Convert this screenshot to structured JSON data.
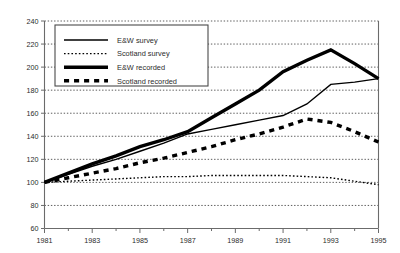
{
  "chart_data": {
    "type": "line",
    "title": "",
    "subtitle": "",
    "xlabel": "",
    "ylabel": "",
    "xlim": [
      1981,
      1995
    ],
    "ylim": [
      60,
      240
    ],
    "yticks": [
      60,
      80,
      100,
      120,
      140,
      160,
      180,
      200,
      220,
      240
    ],
    "xticks": [
      1981,
      1982,
      1983,
      1984,
      1985,
      1986,
      1987,
      1988,
      1989,
      1990,
      1991,
      1992,
      1993,
      1994,
      1995
    ],
    "xtick_labels": [
      "1981",
      "",
      "1983",
      "",
      "1985",
      "",
      "1987",
      "",
      "1989",
      "",
      "1991",
      "",
      "1993",
      "",
      "1995"
    ],
    "ytick_labels": [
      "60",
      "80",
      "100",
      "120",
      "140",
      "160",
      "180",
      "200",
      "220",
      "240"
    ],
    "grid": "horizontal-dotted",
    "legend_position": "top-left-inside",
    "x": [
      1981,
      1982,
      1983,
      1984,
      1985,
      1986,
      1987,
      1988,
      1989,
      1990,
      1991,
      1992,
      1993,
      1994,
      1995
    ],
    "series": [
      {
        "name": "E&W survey",
        "style": "thin-solid",
        "color": "#000000",
        "width": 1.4,
        "values": [
          100,
          107,
          114,
          120,
          127,
          134,
          142,
          146,
          150,
          154,
          158,
          168,
          185,
          187,
          190
        ]
      },
      {
        "name": "Scotland survey",
        "style": "thin-dotted",
        "color": "#000000",
        "width": 1.4,
        "values": [
          100,
          101,
          102,
          103,
          104,
          105,
          105,
          106,
          106,
          106,
          106,
          105,
          104,
          101,
          98
        ]
      },
      {
        "name": "E&W recorded",
        "style": "thick-solid",
        "color": "#000000",
        "width": 3.4,
        "values": [
          100,
          108,
          116,
          123,
          131,
          137,
          144,
          156,
          168,
          180,
          196,
          206,
          215,
          203,
          190
        ]
      },
      {
        "name": "Scotland recorded",
        "style": "thick-dashed",
        "color": "#000000",
        "width": 3.4,
        "values": [
          100,
          104,
          108,
          112,
          117,
          121,
          126,
          131,
          137,
          142,
          148,
          155,
          152,
          144,
          135
        ]
      }
    ]
  },
  "legend": {
    "items": [
      {
        "label": "E&W survey",
        "key": "ew-survey"
      },
      {
        "label": "Scotland survey",
        "key": "scotland-survey"
      },
      {
        "label": "E&W recorded",
        "key": "ew-recorded"
      },
      {
        "label": "Scotland recorded",
        "key": "scotland-recorded"
      }
    ]
  },
  "axis": {
    "y_labels": [
      "240",
      "220",
      "200",
      "180",
      "160",
      "140",
      "120",
      "100",
      "80",
      "60"
    ],
    "x_labels": [
      "1981",
      "1983",
      "1985",
      "1987",
      "1989",
      "1991",
      "1993",
      "1995"
    ]
  },
  "colors": {
    "ink": "#000000",
    "axis": "#6b6b6b",
    "grid": "#4a4a4a",
    "background": "#ffffff"
  }
}
